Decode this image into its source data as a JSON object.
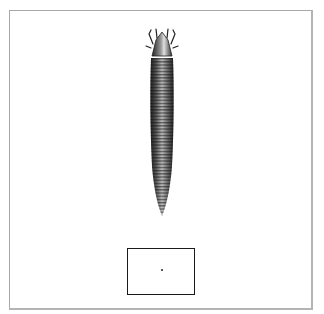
{
  "figure": {
    "colors": {
      "background": "#ffffff",
      "frame": "#a8a8a8",
      "ink": "#1a1a1a"
    },
    "scale_box": {
      "has_center_dot": true
    }
  }
}
